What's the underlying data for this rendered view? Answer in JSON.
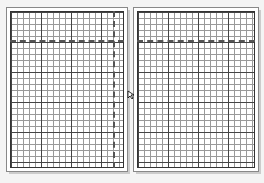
{
  "viewer": {
    "layout": "two-page spread",
    "pages": [
      {
        "name": "left",
        "content": "graph paper grid",
        "guides": [
          "horizontal dashed line",
          "vertical dashed line"
        ]
      },
      {
        "name": "right",
        "content": "graph paper grid",
        "guides": [
          "horizontal dashed line"
        ]
      }
    ]
  },
  "cursor": {
    "icon": "arrow-cursor-icon"
  }
}
